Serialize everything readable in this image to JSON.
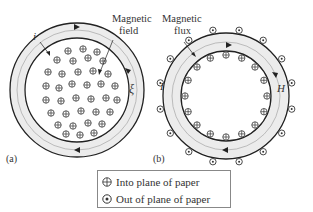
{
  "diagram_a": {
    "panel_label": "(a)",
    "current_label": "i",
    "field_label_line1": "Magnetic",
    "field_label_line2": "field",
    "emf_label": "ξ"
  },
  "diagram_b": {
    "panel_label": "(b)",
    "current_label": "I",
    "flux_label_line1": "Magnetic",
    "flux_label_line2": "flux",
    "field_intensity_label": "H"
  },
  "legend": {
    "items": [
      {
        "symbol": "circle-plus",
        "label": "Into plane of paper"
      },
      {
        "symbol": "circle-dot",
        "label": "Out of plane of paper"
      }
    ]
  },
  "colors": {
    "line": "#222222",
    "band": "#e8e8e8",
    "dashed": "#888888"
  }
}
